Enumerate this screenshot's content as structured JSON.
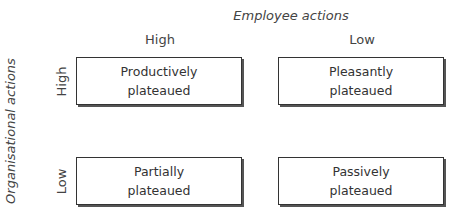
{
  "diagram": {
    "x_axis_title": "Employee actions",
    "y_axis_title": "Organisational actions",
    "columns": [
      "High",
      "Low"
    ],
    "rows": [
      "High",
      "Low"
    ],
    "cells": [
      {
        "row": "High",
        "col": "High",
        "line1": "Productively",
        "line2": "plateaued"
      },
      {
        "row": "High",
        "col": "Low",
        "line1": "Pleasantly",
        "line2": "plateaued"
      },
      {
        "row": "Low",
        "col": "High",
        "line1": "Partially",
        "line2": "plateaued"
      },
      {
        "row": "Low",
        "col": "Low",
        "line1": "Passively",
        "line2": "plateaued"
      }
    ]
  }
}
